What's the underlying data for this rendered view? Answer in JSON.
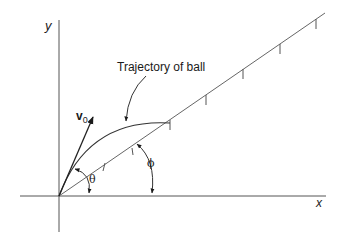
{
  "diagram": {
    "axes": {
      "x_label": "x",
      "y_label": "y"
    },
    "labels": {
      "trajectory": "Trajectory of ball",
      "velocity_main": "v",
      "velocity_sub": "0",
      "theta": "θ",
      "phi": "ϕ"
    },
    "colors": {
      "line": "#555555",
      "text": "#1a1a1a",
      "background": "#ffffff"
    },
    "incline_ticks": 5
  }
}
